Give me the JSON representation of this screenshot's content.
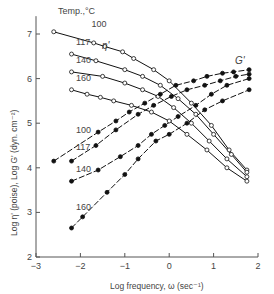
{
  "chart_data": {
    "type": "line",
    "title": "",
    "xlabel": "Log frequency, ω (sec⁻¹)",
    "ylabel": "Log η' (poise), Log G' (dyn. cm⁻²)",
    "xlim": [
      -3,
      2
    ],
    "ylim": [
      2,
      7.4
    ],
    "xticks": [
      -3,
      -2,
      -1,
      0,
      1,
      2
    ],
    "yticks": [
      2,
      3,
      4,
      5,
      6,
      7
    ],
    "grid": false,
    "legend_title": "Temp.,°C",
    "annotations": [
      "η'",
      "G'"
    ],
    "series": [
      {
        "name": "η' 100",
        "group": "eta",
        "temp": "100",
        "marker": "open",
        "x": [
          -2.6,
          -1.7,
          -1.45,
          -1.05,
          -0.8,
          -0.35,
          0.0,
          0.5,
          0.95,
          1.35,
          1.75
        ],
        "y": [
          7.05,
          6.8,
          6.72,
          6.6,
          6.45,
          6.2,
          5.95,
          5.45,
          4.95,
          4.4,
          3.95
        ]
      },
      {
        "name": "η' 117",
        "group": "eta",
        "temp": "117",
        "marker": "open",
        "x": [
          -2.2,
          -1.65,
          -1.0,
          -0.6,
          -0.2,
          0.2,
          0.6,
          1.0,
          1.4,
          1.75
        ],
        "y": [
          6.55,
          6.4,
          6.2,
          6.05,
          5.85,
          5.55,
          5.2,
          4.75,
          4.3,
          3.9
        ]
      },
      {
        "name": "η' 140",
        "group": "eta",
        "temp": "140",
        "marker": "open",
        "x": [
          -2.2,
          -1.5,
          -1.0,
          -0.6,
          -0.25,
          0.1,
          0.5,
          0.9,
          1.3,
          1.75
        ],
        "y": [
          6.15,
          6.05,
          5.9,
          5.75,
          5.6,
          5.35,
          5.0,
          4.6,
          4.2,
          3.8
        ]
      },
      {
        "name": "η' 160",
        "group": "eta",
        "temp": "160",
        "marker": "open",
        "x": [
          -2.2,
          -1.85,
          -1.55,
          -1.25,
          -0.85,
          -0.4,
          0.0,
          0.4,
          0.85,
          1.3,
          1.75
        ],
        "y": [
          5.75,
          5.65,
          5.58,
          5.5,
          5.4,
          5.25,
          5.05,
          4.75,
          4.4,
          4.0,
          3.7
        ]
      },
      {
        "name": "G' 100",
        "group": "G",
        "temp": "100",
        "marker": "filled",
        "x": [
          -2.6,
          -1.6,
          -1.2,
          -0.9,
          -0.55,
          -0.2,
          0.15,
          0.55,
          0.85,
          1.2,
          1.45,
          1.8
        ],
        "y": [
          4.15,
          4.8,
          5.05,
          5.25,
          5.45,
          5.65,
          5.85,
          5.95,
          6.05,
          6.12,
          6.15,
          6.2
        ]
      },
      {
        "name": "G' 117",
        "group": "G",
        "temp": "117",
        "marker": "filled",
        "x": [
          -2.2,
          -1.65,
          -1.2,
          -0.7,
          -0.35,
          0.05,
          0.4,
          0.8,
          1.15,
          1.5,
          1.8
        ],
        "y": [
          4.15,
          4.5,
          4.85,
          5.2,
          5.4,
          5.6,
          5.75,
          5.85,
          5.95,
          6.05,
          6.1
        ]
      },
      {
        "name": "G' 140",
        "group": "G",
        "temp": "140",
        "marker": "filled",
        "x": [
          -2.2,
          -1.6,
          -1.1,
          -0.7,
          -0.4,
          -0.1,
          0.2,
          0.6,
          0.95,
          1.3,
          1.8
        ],
        "y": [
          3.7,
          3.95,
          4.25,
          4.5,
          4.75,
          4.95,
          5.15,
          5.4,
          5.65,
          5.85,
          6.0
        ]
      },
      {
        "name": "G' 160",
        "group": "G",
        "temp": "160",
        "marker": "filled",
        "x": [
          -2.2,
          -1.95,
          -1.4,
          -1.0,
          -0.7,
          -0.3,
          0.0,
          0.4,
          0.8,
          1.2,
          1.8
        ],
        "y": [
          2.65,
          2.9,
          3.45,
          3.85,
          4.2,
          4.6,
          4.75,
          5.0,
          5.3,
          5.5,
          5.75
        ]
      }
    ],
    "curve_labels": [
      {
        "text": "100",
        "x": -1.75,
        "y": 7.15
      },
      {
        "text": "117",
        "x": -2.1,
        "y": 6.75
      },
      {
        "text": "140",
        "x": -2.1,
        "y": 6.35
      },
      {
        "text": "160",
        "x": -2.1,
        "y": 5.95
      },
      {
        "text": "100",
        "x": -2.1,
        "y": 4.78
      },
      {
        "text": "117",
        "x": -2.1,
        "y": 4.4
      },
      {
        "text": "140",
        "x": -2.1,
        "y": 3.9
      },
      {
        "text": "160",
        "x": -2.1,
        "y": 3.05
      }
    ]
  },
  "labels": {
    "legend_title": "Temp.,°C",
    "eta_label": "η'",
    "g_label": "G'",
    "xlabel": "Log frequency, ω (sec⁻¹)",
    "ylabel": "Log η' (poise), Log G' (dyn. cm⁻²)"
  }
}
